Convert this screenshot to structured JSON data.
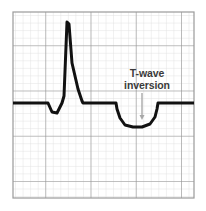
{
  "figure": {
    "background_color": "#ffffff"
  },
  "grid": {
    "x": 13,
    "y": 12,
    "width": 181,
    "height": 186,
    "minor_step": 7.54,
    "major_every": 6,
    "minor_color": "#dcdcdc",
    "major_color": "#8f8f8f",
    "border_color": "#9a9a9a"
  },
  "trace": {
    "color": "#111111",
    "stroke_width": 3.0,
    "baseline_y": 103,
    "path": "M 13,103 L 48,103 L 52,112 L 57,113 L 62,103 L 64,96 L 67,22 L 69,24 L 72,63 L 78,89 L 82,101 L 83,103 L 116,103 L 117,109 L 120,118 L 125,125 L 133,127 L 142,127 L 150,124 L 155,117 L 157,109 L 158,103 L 194,103",
    "features": [
      {
        "name": "isoelectric-baseline-left",
        "from_x": 13,
        "to_x": 48
      },
      {
        "name": "q-wave-dip",
        "min_y": 113
      },
      {
        "name": "r-wave-peak",
        "x": 67,
        "y": 22
      },
      {
        "name": "s-wave-descent",
        "to_x": 83
      },
      {
        "name": "st-segment",
        "from_x": 83,
        "to_x": 116
      },
      {
        "name": "t-wave-inversion",
        "from_x": 116,
        "to_x": 158,
        "trough_y": 127
      },
      {
        "name": "isoelectric-baseline-right",
        "from_x": 158,
        "to_x": 194
      }
    ]
  },
  "annotation": {
    "label_line1": "T-wave",
    "label_line2": "inversion",
    "text_color": "#3a3a3a",
    "text_x": 147,
    "line1_y": 77,
    "line2_y": 89,
    "arrow": {
      "color": "#a8a8a8",
      "x": 142,
      "from_y": 93,
      "to_y": 120,
      "head_width": 5,
      "head_length": 5
    }
  },
  "chart_data": {
    "type": "line",
    "xlabel": "",
    "ylabel": "",
    "grid": true,
    "legend": "none",
    "annotations": [
      "T-wave inversion"
    ],
    "series": [
      {
        "name": "ECG lead",
        "points": [
          [
            0,
            0
          ],
          [
            35,
            0
          ],
          [
            39,
            -9
          ],
          [
            44,
            -10
          ],
          [
            49,
            0
          ],
          [
            51,
            7
          ],
          [
            54,
            81
          ],
          [
            56,
            79
          ],
          [
            59,
            40
          ],
          [
            65,
            14
          ],
          [
            69,
            2
          ],
          [
            70,
            0
          ],
          [
            103,
            0
          ],
          [
            104,
            -6
          ],
          [
            107,
            -15
          ],
          [
            112,
            -22
          ],
          [
            120,
            -24
          ],
          [
            129,
            -24
          ],
          [
            137,
            -21
          ],
          [
            142,
            -14
          ],
          [
            144,
            -6
          ],
          [
            145,
            0
          ],
          [
            181,
            0
          ]
        ]
      }
    ]
  }
}
